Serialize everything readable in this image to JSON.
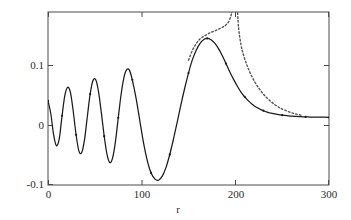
{
  "chart_data": {
    "type": "line",
    "title": "",
    "subtitle": "",
    "xlabel": "r",
    "ylabel": "",
    "xlim": [
      0,
      300
    ],
    "ylim": [
      -0.1,
      0.155
    ],
    "xticks": [
      0,
      100,
      200,
      300
    ],
    "xtick_labels": [
      "0",
      "100",
      "200",
      "300"
    ],
    "yticks": [
      -0.1,
      0,
      0.1
    ],
    "ytick_labels": [
      "-0.1",
      "0",
      "0.1"
    ],
    "grid": false,
    "legend": null,
    "annotations": [],
    "series": [
      {
        "name": "solid-curve",
        "style": "solid",
        "color": "#1a1a1a",
        "markers": "small-dots",
        "x": [
          0,
          3,
          6,
          9,
          12,
          15,
          18,
          21,
          24,
          27,
          30,
          33,
          36,
          39,
          42,
          45,
          48,
          51,
          54,
          57,
          60,
          63,
          66,
          69,
          72,
          75,
          78,
          81,
          84,
          87,
          90,
          94,
          98,
          102,
          106,
          110,
          114,
          118,
          122,
          126,
          130,
          134,
          138,
          142,
          146,
          150,
          154,
          158,
          162,
          166,
          170,
          174,
          178,
          182,
          186,
          190,
          194,
          198,
          202,
          206,
          210,
          214,
          218,
          222,
          226,
          230,
          234,
          238,
          242,
          246,
          250,
          255,
          260,
          265,
          270,
          275,
          280,
          285,
          290,
          295,
          300
        ],
        "y": [
          0.024,
          0.005,
          -0.026,
          -0.042,
          -0.032,
          0.002,
          0.032,
          0.044,
          0.036,
          0.008,
          -0.026,
          -0.05,
          -0.052,
          -0.033,
          0.001,
          0.034,
          0.054,
          0.055,
          0.037,
          0.006,
          -0.028,
          -0.055,
          -0.067,
          -0.06,
          -0.036,
          -0.001,
          0.033,
          0.058,
          0.07,
          0.069,
          0.055,
          0.028,
          -0.005,
          -0.038,
          -0.064,
          -0.082,
          -0.091,
          -0.093,
          -0.087,
          -0.074,
          -0.055,
          -0.032,
          -0.007,
          0.019,
          0.043,
          0.065,
          0.084,
          0.098,
          0.108,
          0.114,
          0.116,
          0.114,
          0.109,
          0.101,
          0.091,
          0.079,
          0.067,
          0.056,
          0.046,
          0.037,
          0.03,
          0.024,
          0.019,
          0.015,
          0.012,
          0.0095,
          0.0075,
          0.006,
          0.0047,
          0.0037,
          0.0029,
          0.0021,
          0.0015,
          0.001,
          0.0007,
          0.0004,
          0.0002,
          0.0001,
          5e-05,
          0.0,
          -0.0005
        ]
      },
      {
        "name": "dotted-curve",
        "style": "dotted",
        "color": "#555555",
        "markers": "none",
        "note": "diverges (singularity) near r = 200",
        "x": [
          150,
          154,
          158,
          162,
          166,
          170,
          174,
          178,
          181,
          184,
          187,
          190,
          193,
          195,
          196,
          197,
          198,
          198.6,
          199,
          199.3,
          199.6,
          199.9,
          200.2,
          200.6,
          201,
          201.5,
          202,
          203,
          204,
          206,
          208,
          211,
          214,
          218,
          222,
          226,
          230,
          234,
          238,
          242,
          246,
          250,
          255,
          260,
          265,
          270
        ],
        "y": [
          0.084,
          0.098,
          0.108,
          0.115,
          0.119,
          0.122,
          0.125,
          0.127,
          0.129,
          0.131,
          0.133,
          0.136,
          0.141,
          0.148,
          0.153,
          0.162,
          0.18,
          0.2,
          0.23,
          0.26,
          0.3,
          0.36,
          0.34,
          0.28,
          0.23,
          0.19,
          0.165,
          0.14,
          0.125,
          0.107,
          0.095,
          0.082,
          0.071,
          0.059,
          0.049,
          0.041,
          0.034,
          0.028,
          0.023,
          0.0185,
          0.015,
          0.012,
          0.009,
          0.0065,
          0.0045,
          0.003
        ]
      }
    ]
  },
  "axes": {
    "x_title": "r",
    "ytick_labels": [
      "0.1",
      "0",
      "-0.1"
    ],
    "xtick_labels": [
      "0",
      "100",
      "200",
      "300"
    ]
  }
}
